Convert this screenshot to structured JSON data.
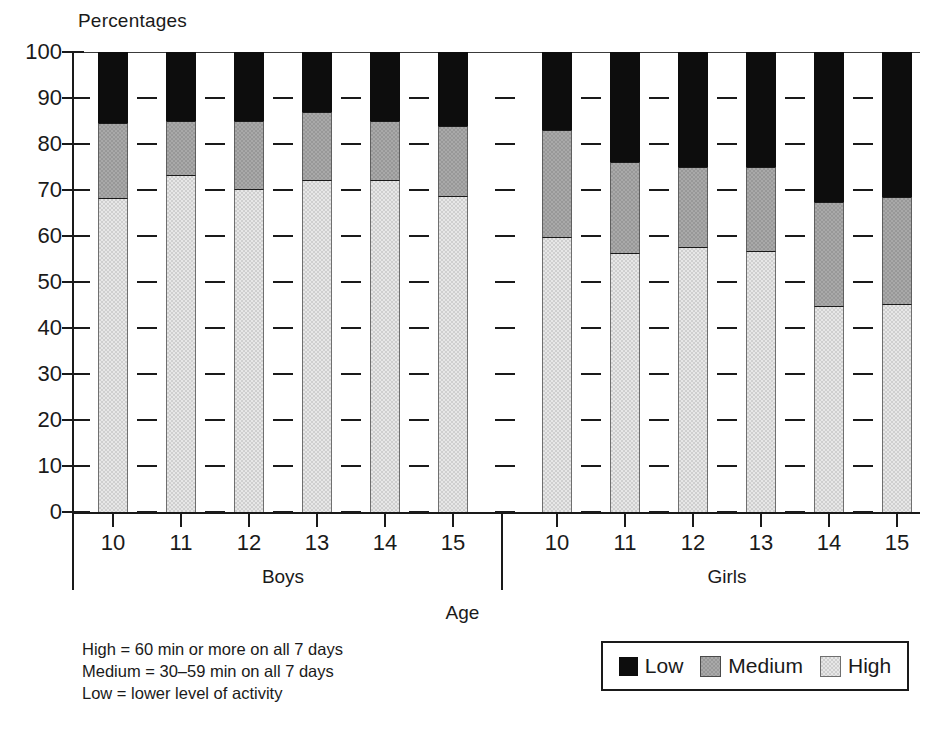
{
  "chart_data": {
    "type": "bar",
    "stacked": true,
    "title": "",
    "ylabel": "Percentages",
    "xlabel": "Age",
    "ylim": [
      0,
      100
    ],
    "yticks": [
      0,
      10,
      20,
      30,
      40,
      50,
      60,
      70,
      80,
      90,
      100
    ],
    "grid": true,
    "legend_position": "bottom-right",
    "categories": [
      "10",
      "11",
      "12",
      "13",
      "14",
      "15",
      "10",
      "11",
      "12",
      "13",
      "14",
      "15"
    ],
    "groups": [
      {
        "label": "Boys",
        "categories": [
          "10",
          "11",
          "12",
          "13",
          "14",
          "15"
        ]
      },
      {
        "label": "Girls",
        "categories": [
          "10",
          "11",
          "12",
          "13",
          "14",
          "15"
        ]
      }
    ],
    "series": [
      {
        "name": "High",
        "color": "#cfcfcf",
        "values": [
          68.0,
          73.0,
          70.0,
          72.0,
          72.0,
          68.5,
          59.5,
          56.0,
          57.5,
          56.5,
          44.5,
          45.0
        ]
      },
      {
        "name": "Medium",
        "color": "#989898",
        "values": [
          16.5,
          12.0,
          15.0,
          15.0,
          13.0,
          15.5,
          23.5,
          20.0,
          17.5,
          18.5,
          23.0,
          23.5
        ]
      },
      {
        "name": "Low",
        "color": "#0d0d0d",
        "values": [
          15.5,
          15.0,
          15.0,
          13.0,
          15.0,
          16.0,
          17.0,
          24.0,
          25.0,
          25.0,
          32.5,
          31.5
        ]
      }
    ],
    "cumulative_tops": {
      "high": [
        68.0,
        73.0,
        70.0,
        72.0,
        72.0,
        68.5,
        59.5,
        56.0,
        57.5,
        56.5,
        44.5,
        45.0
      ],
      "medium": [
        84.5,
        85.0,
        85.0,
        87.0,
        85.0,
        84.0,
        83.0,
        76.0,
        75.0,
        75.0,
        67.5,
        68.5
      ],
      "low": [
        100,
        100,
        100,
        100,
        100,
        100,
        100,
        100,
        100,
        100,
        100,
        100
      ]
    }
  },
  "legend": {
    "items": [
      {
        "label": "Low",
        "swatch": "low"
      },
      {
        "label": "Medium",
        "swatch": "medium"
      },
      {
        "label": "High",
        "swatch": "high"
      }
    ]
  },
  "footnote": {
    "lines": [
      "High = 60 min or more on all 7 days",
      "Medium = 30–59 min on all 7 days",
      "Low = lower level of activity"
    ]
  }
}
